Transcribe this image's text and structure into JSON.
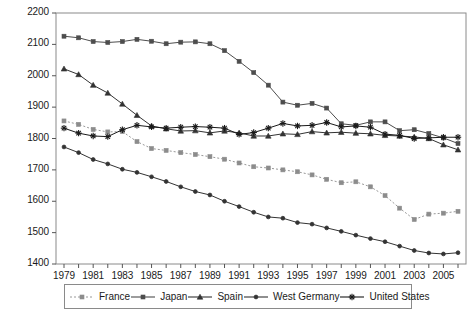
{
  "chart_data": {
    "type": "line",
    "title": "",
    "xlabel": "",
    "ylabel": "",
    "xlim": [
      1979,
      2006
    ],
    "ylim": [
      1400,
      2200
    ],
    "grid": false,
    "legend_position": "bottom",
    "x": [
      1979,
      1980,
      1981,
      1982,
      1983,
      1984,
      1985,
      1986,
      1987,
      1988,
      1989,
      1990,
      1991,
      1992,
      1993,
      1994,
      1995,
      1996,
      1997,
      1998,
      1999,
      2000,
      2001,
      2002,
      2003,
      2004,
      2005,
      2006
    ],
    "ytick_labels": [
      "2200",
      "2100",
      "2000",
      "1900",
      "1800",
      "1700",
      "1600",
      "1500",
      "1400"
    ],
    "ytick_values": [
      2200,
      2100,
      2000,
      1900,
      1800,
      1700,
      1600,
      1500,
      1400
    ],
    "xtick_labels": [
      "1979",
      "1981",
      "1983",
      "1985",
      "1987",
      "1989",
      "1991",
      "1993",
      "1995",
      "1997",
      "1999",
      "2001",
      "2003",
      "2005"
    ],
    "xtick_values": [
      1979,
      1981,
      1983,
      1985,
      1987,
      1989,
      1991,
      1993,
      1995,
      1997,
      1999,
      2001,
      2003,
      2005
    ],
    "series": [
      {
        "name": "France",
        "color": "#8c8c8c",
        "marker": "square",
        "dash": "dotted",
        "values": [
          1856,
          1845,
          1829,
          1821,
          1822,
          1790,
          1768,
          1762,
          1755,
          1749,
          1742,
          1734,
          1722,
          1710,
          1706,
          1700,
          1694,
          1684,
          1670,
          1659,
          1662,
          1646,
          1618,
          1578,
          1542,
          1559,
          1562,
          1568
        ]
      },
      {
        "name": "Japan",
        "color": "#4d4d4d",
        "marker": "square",
        "dash": "solid",
        "values": [
          2126,
          2121,
          2109,
          2106,
          2109,
          2116,
          2110,
          2102,
          2107,
          2108,
          2102,
          2080,
          2046,
          2010,
          1970,
          1916,
          1906,
          1912,
          1897,
          1847,
          1842,
          1853,
          1853,
          1825,
          1828,
          1816,
          1802,
          1784
        ]
      },
      {
        "name": "Spain",
        "color": "#333333",
        "marker": "triangle",
        "dash": "solid",
        "values": [
          2022,
          2004,
          1970,
          1945,
          1910,
          1874,
          1840,
          1831,
          1824,
          1825,
          1818,
          1824,
          1818,
          1808,
          1808,
          1815,
          1813,
          1822,
          1818,
          1820,
          1817,
          1815,
          1810,
          1808,
          1805,
          1800,
          1780,
          1764
        ]
      },
      {
        "name": "West Germany",
        "color": "#333333",
        "marker": "circle",
        "dash": "solid",
        "values": [
          1773,
          1755,
          1733,
          1719,
          1702,
          1692,
          1678,
          1663,
          1646,
          1631,
          1620,
          1600,
          1583,
          1565,
          1550,
          1546,
          1532,
          1527,
          1515,
          1504,
          1492,
          1481,
          1471,
          1457,
          1443,
          1435,
          1432,
          1436
        ]
      },
      {
        "name": "United States",
        "color": "#1a1a1a",
        "marker": "star",
        "dash": "solid",
        "values": [
          1833,
          1817,
          1808,
          1806,
          1828,
          1842,
          1837,
          1833,
          1836,
          1838,
          1836,
          1833,
          1813,
          1819,
          1833,
          1848,
          1840,
          1842,
          1851,
          1837,
          1840,
          1836,
          1814,
          1810,
          1800,
          1802,
          1804,
          1804
        ]
      }
    ]
  },
  "legend": {
    "items": [
      {
        "label": "France"
      },
      {
        "label": "Japan"
      },
      {
        "label": "Spain"
      },
      {
        "label": "West Germany"
      },
      {
        "label": "United States"
      }
    ]
  }
}
